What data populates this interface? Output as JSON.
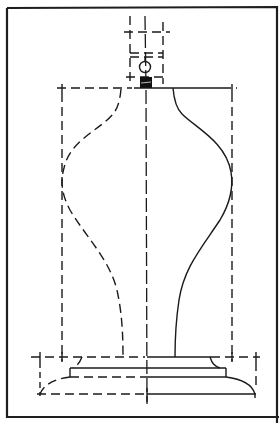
{
  "figure": {
    "colors": {
      "ink": "#1a1a1a",
      "background": "#ffffff"
    },
    "parts": [
      {
        "name": "frame",
        "style": "solid"
      },
      {
        "name": "lamp-socket",
        "style": "dashed-outline",
        "features": [
          "socket-ring",
          "switch-knob",
          "threaded-nipple"
        ]
      },
      {
        "name": "vase-body-left-profile",
        "style": "dashed"
      },
      {
        "name": "vase-body-right-profile",
        "style": "solid"
      },
      {
        "name": "centerline",
        "style": "dash-long"
      },
      {
        "name": "bounding-box",
        "style": "dashed"
      },
      {
        "name": "plinth-base",
        "style": "mixed"
      }
    ]
  }
}
